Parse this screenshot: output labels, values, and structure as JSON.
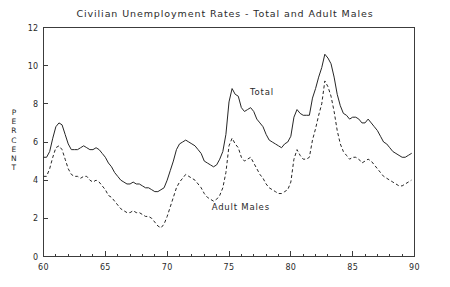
{
  "chart_data": {
    "type": "line",
    "title": "Civilian Unemployment Rates - Total and Adult Males",
    "xlabel": "",
    "ylabel": "PERCENT",
    "xlim": [
      60,
      90
    ],
    "ylim": [
      0,
      12
    ],
    "ytick_labels": [
      "0",
      "2",
      "4",
      "6",
      "8",
      "10",
      "12"
    ],
    "yticks": [
      0,
      2,
      4,
      6,
      8,
      10,
      12
    ],
    "xtick_labels": [
      "60",
      "65",
      "70",
      "75",
      "80",
      "85",
      "90"
    ],
    "xticks": [
      60,
      65,
      70,
      75,
      80,
      85,
      90
    ],
    "x_minor_step": 1,
    "grid": false,
    "legend_position": "inline-annotations",
    "annotations": [
      {
        "text": "Total",
        "x": 76.7,
        "y": 8.45
      },
      {
        "text": "Adult Males",
        "x": 73.6,
        "y": 2.45
      }
    ],
    "x": [
      60.0,
      60.25,
      60.5,
      60.75,
      61.0,
      61.25,
      61.5,
      61.75,
      62.0,
      62.25,
      62.5,
      62.75,
      63.0,
      63.25,
      63.5,
      63.75,
      64.0,
      64.25,
      64.5,
      64.75,
      65.0,
      65.25,
      65.5,
      65.75,
      66.0,
      66.25,
      66.5,
      66.75,
      67.0,
      67.25,
      67.5,
      67.75,
      68.0,
      68.25,
      68.5,
      68.75,
      69.0,
      69.25,
      69.5,
      69.75,
      70.0,
      70.25,
      70.5,
      70.75,
      71.0,
      71.25,
      71.5,
      71.75,
      72.0,
      72.25,
      72.5,
      72.75,
      73.0,
      73.25,
      73.5,
      73.75,
      74.0,
      74.25,
      74.5,
      74.75,
      75.0,
      75.25,
      75.5,
      75.75,
      76.0,
      76.25,
      76.5,
      76.75,
      77.0,
      77.25,
      77.5,
      77.75,
      78.0,
      78.25,
      78.5,
      78.75,
      79.0,
      79.25,
      79.5,
      79.75,
      80.0,
      80.25,
      80.5,
      80.75,
      81.0,
      81.25,
      81.5,
      81.75,
      82.0,
      82.25,
      82.5,
      82.75,
      83.0,
      83.25,
      83.5,
      83.75,
      84.0,
      84.25,
      84.5,
      84.75,
      85.0,
      85.25,
      85.5,
      85.75,
      86.0,
      86.25,
      86.5,
      86.75,
      87.0,
      87.25,
      87.5,
      87.75,
      88.0,
      88.25,
      88.5,
      88.75,
      89.0,
      89.25,
      89.5,
      89.75
    ],
    "series": [
      {
        "name": "Total",
        "style": "solid",
        "values": [
          5.2,
          5.2,
          5.5,
          6.2,
          6.8,
          7.0,
          6.9,
          6.4,
          5.9,
          5.6,
          5.6,
          5.6,
          5.7,
          5.8,
          5.7,
          5.6,
          5.6,
          5.7,
          5.6,
          5.4,
          5.2,
          4.9,
          4.7,
          4.4,
          4.2,
          4.0,
          3.9,
          3.8,
          3.8,
          3.9,
          3.8,
          3.8,
          3.7,
          3.6,
          3.6,
          3.5,
          3.4,
          3.4,
          3.5,
          3.6,
          4.0,
          4.5,
          5.0,
          5.6,
          5.9,
          6.0,
          6.1,
          6.0,
          5.9,
          5.8,
          5.6,
          5.4,
          5.0,
          4.9,
          4.8,
          4.7,
          4.8,
          5.1,
          5.5,
          6.4,
          8.1,
          8.8,
          8.5,
          8.4,
          7.8,
          7.6,
          7.7,
          7.8,
          7.6,
          7.2,
          7.0,
          6.8,
          6.4,
          6.1,
          6.0,
          5.9,
          5.8,
          5.7,
          5.9,
          6.0,
          6.3,
          7.3,
          7.7,
          7.5,
          7.4,
          7.4,
          7.4,
          8.3,
          8.8,
          9.4,
          9.9,
          10.6,
          10.4,
          10.1,
          9.4,
          8.5,
          7.9,
          7.5,
          7.4,
          7.2,
          7.3,
          7.3,
          7.2,
          7.0,
          7.0,
          7.2,
          7.0,
          6.8,
          6.6,
          6.3,
          6.0,
          5.9,
          5.7,
          5.5,
          5.4,
          5.3,
          5.2,
          5.2,
          5.3,
          5.4
        ]
      },
      {
        "name": "Adult Males",
        "style": "dashed",
        "values": [
          4.2,
          4.2,
          4.6,
          5.2,
          5.7,
          5.8,
          5.6,
          5.1,
          4.6,
          4.3,
          4.2,
          4.2,
          4.1,
          4.2,
          4.2,
          4.0,
          3.9,
          4.0,
          3.9,
          3.7,
          3.5,
          3.2,
          3.1,
          2.9,
          2.7,
          2.5,
          2.4,
          2.3,
          2.3,
          2.4,
          2.3,
          2.3,
          2.2,
          2.1,
          2.1,
          2.0,
          1.8,
          1.6,
          1.5,
          1.7,
          2.1,
          2.6,
          3.1,
          3.6,
          3.9,
          4.1,
          4.3,
          4.2,
          4.1,
          4.0,
          3.8,
          3.6,
          3.3,
          3.1,
          3.0,
          2.9,
          3.0,
          3.2,
          3.6,
          4.4,
          5.8,
          6.2,
          5.9,
          5.7,
          5.2,
          5.0,
          5.1,
          5.2,
          4.9,
          4.6,
          4.3,
          4.1,
          3.8,
          3.6,
          3.5,
          3.4,
          3.3,
          3.3,
          3.4,
          3.5,
          3.9,
          5.1,
          5.6,
          5.3,
          5.1,
          5.1,
          5.2,
          6.1,
          6.7,
          7.4,
          8.0,
          9.2,
          8.9,
          8.4,
          7.6,
          6.6,
          5.9,
          5.5,
          5.3,
          5.1,
          5.2,
          5.2,
          5.1,
          4.9,
          5.0,
          5.1,
          5.0,
          4.8,
          4.6,
          4.4,
          4.2,
          4.1,
          4.0,
          3.9,
          3.8,
          3.7,
          3.7,
          3.8,
          3.9,
          4.0
        ]
      }
    ]
  },
  "chart": {
    "title": "Civilian Unemployment Rates - Total and Adult Males",
    "ylabel_letters": [
      "P",
      "E",
      "R",
      "C",
      "E",
      "N",
      "T"
    ]
  }
}
